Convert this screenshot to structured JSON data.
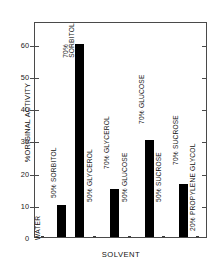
{
  "chart_data": {
    "type": "bar",
    "title": "",
    "xlabel": "SOLVENT",
    "ylabel": "%ORIGINAL ACTIVITY",
    "ylim": [
      0,
      67
    ],
    "yticks": [
      10,
      20,
      30,
      40,
      50,
      60
    ],
    "ytick_labels": [
      "10",
      "20",
      "30",
      "40",
      "50",
      "60"
    ],
    "grid": false,
    "legend": false,
    "categories": [
      "WATER",
      "50% SORBITOL",
      "70% SORBITOL",
      "50% GLYCEROL",
      "70% GLYCEROL",
      "50% GLUCOSE",
      "70% GLUCOSE",
      "50% SUCROSE",
      "70% SUCROSE",
      "20% PROPYLENE GLYCOL"
    ],
    "values": [
      0,
      10,
      60,
      0,
      15,
      0,
      30,
      0,
      16.5,
      0
    ],
    "bar_color": "#000000"
  },
  "bars": [
    {
      "label": "WATER",
      "label_top": "WATER",
      "label_bottom": "",
      "value": 0,
      "x": 6,
      "w": 2.5,
      "label_x": 7,
      "label_y": 210,
      "two_line": false
    },
    {
      "label": "50% SORBITOL",
      "label_top": "50% SORBITOL",
      "label_bottom": "",
      "value": 10,
      "x": 22,
      "w": 9,
      "label_x": 23,
      "label_y": 168,
      "two_line": false
    },
    {
      "label": "70% SORBITOL",
      "label_top": "70%",
      "label_bottom": "SORBITOL",
      "value": 60,
      "x": 40,
      "w": 9,
      "label_x": 41,
      "label_y": 22,
      "two_line": true
    },
    {
      "label": "50% GLYCEROL",
      "label_top": "50% GLYCEROL",
      "label_bottom": "",
      "value": 0,
      "x": 58,
      "w": 2.5,
      "label_x": 59,
      "label_y": 172,
      "two_line": false
    },
    {
      "label": "70% GLYCEROL",
      "label_top": "70% GLYCEROL",
      "label_bottom": "",
      "value": 15,
      "x": 75,
      "w": 9,
      "label_x": 76,
      "label_y": 139,
      "two_line": false
    },
    {
      "label": "50% GLUCOSE",
      "label_top": "50% GLUCOSE",
      "label_bottom": "",
      "value": 0,
      "x": 93,
      "w": 2.5,
      "label_x": 94,
      "label_y": 172,
      "two_line": false
    },
    {
      "label": "70% GLUCOSE",
      "label_top": "70% GLUCOSE",
      "label_bottom": "",
      "value": 30,
      "x": 110,
      "w": 9,
      "label_x": 111,
      "label_y": 94,
      "two_line": false
    },
    {
      "label": "50% SUCROSE",
      "label_top": "50% SUCROSE",
      "label_bottom": "",
      "value": 0,
      "x": 127,
      "w": 2.5,
      "label_x": 128,
      "label_y": 172,
      "two_line": false
    },
    {
      "label": "70% SUCROSE",
      "label_top": "70% SUCROSE",
      "label_bottom": "",
      "value": 16.5,
      "x": 144,
      "w": 9,
      "label_x": 145,
      "label_y": 135,
      "two_line": false
    },
    {
      "label": "20% PROPYLENE GLYCOL",
      "label_top": "20% PROPYLENE GLYCOL",
      "label_bottom": "",
      "value": 0,
      "x": 161,
      "w": 2.5,
      "label_x": 162,
      "label_y": 201,
      "two_line": false
    }
  ]
}
